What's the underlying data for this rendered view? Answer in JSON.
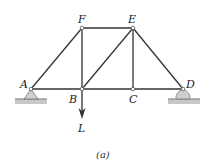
{
  "diagram": {
    "type": "truss",
    "caption": "(a)",
    "joints": {
      "A": {
        "label": "A",
        "x": 31,
        "y": 89
      },
      "B": {
        "label": "B",
        "x": 82,
        "y": 89
      },
      "C": {
        "label": "C",
        "x": 133,
        "y": 89
      },
      "D": {
        "label": "D",
        "x": 183,
        "y": 89
      },
      "E": {
        "label": "E",
        "x": 133,
        "y": 28
      },
      "F": {
        "label": "F",
        "x": 82,
        "y": 28
      }
    },
    "members": [
      "AB",
      "BC",
      "CD",
      "AF",
      "FE",
      "ED",
      "FB",
      "BE",
      "EC"
    ],
    "supports": [
      {
        "joint": "A",
        "type": "pin"
      },
      {
        "joint": "D",
        "type": "roller"
      }
    ],
    "load": {
      "joint": "B",
      "label": "L",
      "direction": "down"
    },
    "colors": {
      "member": "#333333",
      "support": "#cfcfcf",
      "ground": "#bdbdbd"
    }
  }
}
